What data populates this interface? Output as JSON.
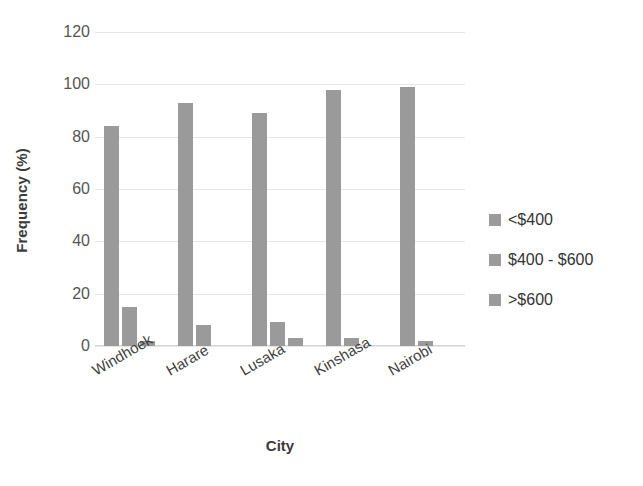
{
  "chart_data": {
    "type": "bar",
    "title": "",
    "xlabel": "City",
    "ylabel": "Frequency (%)",
    "ylim": [
      0,
      120
    ],
    "ytick_step": 20,
    "yticks": [
      120,
      100,
      80,
      60,
      40,
      20,
      0
    ],
    "grid": true,
    "legend_position": "right",
    "categories": [
      "Windhoek",
      "Harare",
      "Lusaka",
      "Kinshasa",
      "Nairobi"
    ],
    "series": [
      {
        "name": "<$400",
        "values": [
          84,
          93,
          89,
          98,
          99
        ]
      },
      {
        "name": "$400 - $600",
        "values": [
          15,
          8,
          9,
          3,
          2
        ]
      },
      {
        "name": ">$600",
        "values": [
          2,
          0,
          3,
          0,
          0
        ]
      }
    ],
    "colors": {
      "bar": "#9a9a9a",
      "gridline": "#e6e6e6",
      "axis_text": "#555555",
      "title_text": "#3b3b3b",
      "background": "#ffffff"
    }
  },
  "legend": {
    "items": [
      {
        "label": "<$400"
      },
      {
        "label": "$400 - $600"
      },
      {
        "label": ">$600"
      }
    ]
  }
}
